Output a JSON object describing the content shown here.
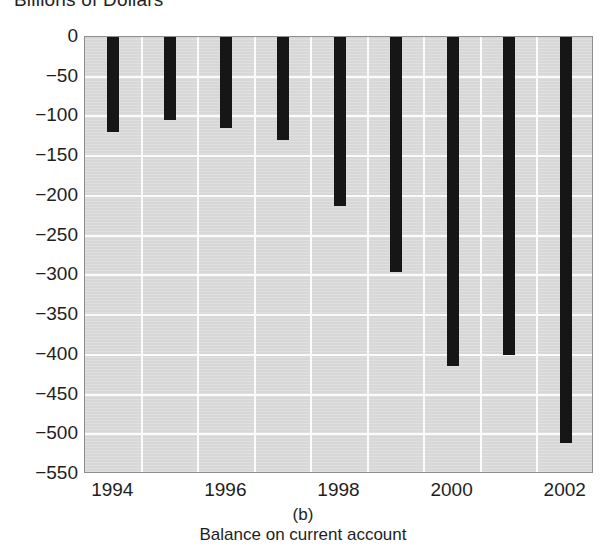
{
  "chart_data": {
    "type": "bar",
    "title": "Billions of Dollars",
    "subtitle": "(b)",
    "caption": "Balance on current account",
    "xlabel": "",
    "ylabel": "Billions of Dollars",
    "categories": [
      "1994",
      "1995",
      "1996",
      "1997",
      "1998",
      "1999",
      "2000",
      "2001",
      "2002"
    ],
    "values": [
      -120,
      -105,
      -115,
      -130,
      -213,
      -296,
      -414,
      -400,
      -511
    ],
    "x_tick_labels": [
      "1994",
      "1996",
      "1998",
      "2000",
      "2002"
    ],
    "x_tick_categories": [
      "1994",
      "1996",
      "1998",
      "2000",
      "2002"
    ],
    "y_tick_labels": [
      "0",
      "−50",
      "−100",
      "−150",
      "−200",
      "−250",
      "−300",
      "−350",
      "−400",
      "−450",
      "−500",
      "−550"
    ],
    "y_tick_values": [
      0,
      -50,
      -100,
      -150,
      -200,
      -250,
      -300,
      -350,
      -400,
      -450,
      -500,
      -550
    ],
    "ylim": [
      -550,
      0
    ],
    "grid": true,
    "legend": null,
    "bar_color": "#161616",
    "plot_background_color": "#d7d7d7",
    "gridline_color": "#fbfbfb",
    "axis_border_color": "#8e8e8e"
  }
}
